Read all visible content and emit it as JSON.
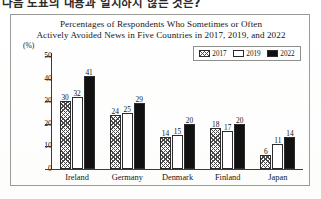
{
  "prompt": {
    "text_visible": "다음 도표의 내용과 일치하지 않는 것은?",
    "underlined_fragment": "않는"
  },
  "chart_data": {
    "type": "bar",
    "title_line1": "Percentages of Respondents Who Sometimes or Often",
    "title_line2": "Actively Avoided News in Five Countries in 2017, 2019, and 2022",
    "unit_label": "(%)",
    "xlabel": "",
    "ylabel": "",
    "ylim": [
      0,
      50
    ],
    "yticks": [
      0,
      10,
      20,
      30,
      40,
      50
    ],
    "ytick_labels": [
      "0",
      "10",
      "20",
      "30",
      "40",
      "50"
    ],
    "grid": false,
    "legend_position": "top-right",
    "categories": [
      "Ireland",
      "Germany",
      "Denmark",
      "Finland",
      "Japan"
    ],
    "series": [
      {
        "name": "2017",
        "fill": "hatched",
        "color": "#4a4a4a",
        "values": [
          30,
          24,
          14,
          18,
          6
        ]
      },
      {
        "name": "2019",
        "fill": "white",
        "color": "#ffffff",
        "values": [
          32,
          25,
          15,
          17,
          11
        ]
      },
      {
        "name": "2022",
        "fill": "solid-black",
        "color": "#111111",
        "values": [
          41,
          29,
          20,
          20,
          14
        ]
      }
    ]
  }
}
